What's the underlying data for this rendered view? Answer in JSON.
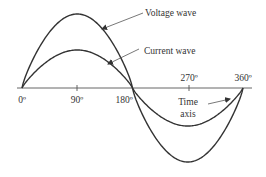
{
  "diagram": {
    "labels": {
      "voltage_wave": "Voltage wave",
      "current_wave": "Current wave",
      "time_axis_line1": "Time",
      "time_axis_line2": "axis"
    },
    "ticks": [
      {
        "label": "0º",
        "angle": 0
      },
      {
        "label": "90º",
        "angle": 90
      },
      {
        "label": "180º",
        "angle": 180
      },
      {
        "label": "270º",
        "angle": 270
      },
      {
        "label": "360º",
        "angle": 360
      }
    ],
    "series": [
      {
        "name": "Voltage wave",
        "amplitude_px": 74
      },
      {
        "name": "Current wave",
        "amplitude_px": 38
      }
    ],
    "colors": {
      "stroke": "#333333",
      "background": "#ffffff"
    }
  }
}
